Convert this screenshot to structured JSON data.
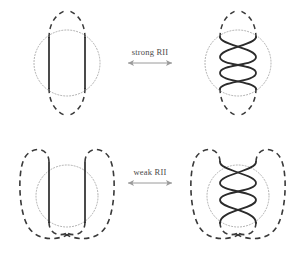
{
  "figure": {
    "background": "#ffffff",
    "width": 293,
    "height": 260
  },
  "colors": {
    "strand": "#2b2b2b",
    "dashed_curve": "#3a3a3a",
    "dotted_circle": "#9a9a9a",
    "arrow": "#9a9a9a",
    "label_text": "#4a4a4a"
  },
  "relations": [
    {
      "id": "strong-rii",
      "label": "strong RII",
      "arrow": "double-headed-horizontal",
      "row": "top"
    },
    {
      "id": "weak-rii",
      "label": "weak RII",
      "arrow": "double-headed-horizontal",
      "row": "bottom"
    }
  ],
  "panels": [
    {
      "id": "top-left",
      "name": "strong-rii-left-diagram",
      "frame": "lens",
      "strands": "parallel",
      "crossings": 0,
      "strand_count": 2
    },
    {
      "id": "top-right",
      "name": "strong-rii-right-diagram",
      "frame": "lens",
      "strands": "braided",
      "crossings": 5,
      "strand_count": 2
    },
    {
      "id": "bottom-left",
      "name": "weak-rii-left-diagram",
      "frame": "loops",
      "strands": "parallel",
      "crossings": 0,
      "strand_count": 2
    },
    {
      "id": "bottom-right",
      "name": "weak-rii-right-diagram",
      "frame": "loops",
      "strands": "braided",
      "crossings": 5,
      "strand_count": 2
    }
  ]
}
